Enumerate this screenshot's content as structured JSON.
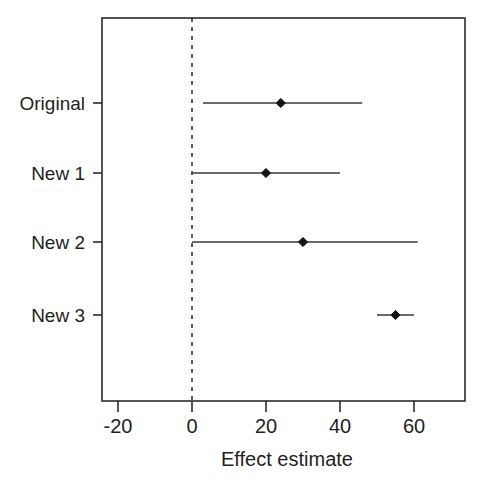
{
  "chart_data": {
    "type": "scatter",
    "subtype": "forest-plot",
    "title": "",
    "xlabel": "Effect estimate",
    "ylabel": "",
    "xlim": [
      -24.3,
      73.8
    ],
    "xticks": [
      -20,
      0,
      20,
      40,
      60
    ],
    "xticklabels": [
      "-20",
      "0",
      "20",
      "40",
      "60"
    ],
    "categories": [
      "Original",
      "New 1",
      "New 2",
      "New 3"
    ],
    "grid": false,
    "legend": false,
    "reference_line": {
      "x": 0,
      "style": "dashed"
    },
    "marker": "diamond",
    "rows": [
      {
        "label": "Original",
        "estimate": 24,
        "ci_low": 3,
        "ci_high": 46
      },
      {
        "label": "New 1",
        "estimate": 20,
        "ci_low": 0,
        "ci_high": 40
      },
      {
        "label": "New 2",
        "estimate": 30,
        "ci_low": 0,
        "ci_high": 61
      },
      {
        "label": "New 3",
        "estimate": 55,
        "ci_low": 50,
        "ci_high": 60
      }
    ],
    "estimates": [
      24,
      20,
      30,
      55
    ],
    "ci_low": [
      3,
      0,
      0,
      50
    ],
    "ci_high": [
      46,
      40,
      61,
      60
    ]
  },
  "axis": {
    "x_title": "Effect estimate",
    "tick_0": "-20",
    "tick_1": "0",
    "tick_2": "20",
    "tick_3": "40",
    "tick_4": "60"
  },
  "categories": {
    "row_0": "Original",
    "row_1": "New 1",
    "row_2": "New 2",
    "row_3": "New 3"
  },
  "colors": {
    "background": "#ffffff",
    "axis": "#2b2b2b",
    "text": "#231f20",
    "marker": "#141414",
    "interval": "#3a3a3a"
  }
}
